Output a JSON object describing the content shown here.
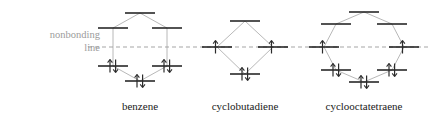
{
  "figure": {
    "background_color": "#ffffff",
    "width": 431,
    "height": 125
  },
  "nonbonding": {
    "label_line1": "nonbonding",
    "label_line2": "line",
    "color": "#9b9b9b",
    "y": 47,
    "x_start": 88,
    "x_end": 428,
    "dash": "4 3"
  },
  "colors": {
    "level_bar": "#1a1a1a",
    "connector": "#b0b0b0",
    "electron": "#2b2b2b",
    "label_text": "#1a1a1a",
    "nonbonding_text": "#9b9b9b"
  },
  "molecules": [
    {
      "name": "benzene",
      "label": "benzene",
      "ring_size": 6,
      "pi_electrons": 6,
      "center_x": 140,
      "levels": [
        {
          "id": "b1",
          "x": 140,
          "y": 13,
          "width": 30,
          "electrons": 0,
          "degeneracy": 1,
          "type": "antibonding"
        },
        {
          "id": "b2",
          "x": 113,
          "y": 28,
          "width": 30,
          "electrons": 0,
          "degeneracy": 2,
          "type": "antibonding"
        },
        {
          "id": "b3",
          "x": 167,
          "y": 28,
          "width": 30,
          "electrons": 0,
          "degeneracy": 2,
          "type": "antibonding"
        },
        {
          "id": "b4",
          "x": 113,
          "y": 66,
          "width": 30,
          "electrons": 2,
          "degeneracy": 2,
          "type": "bonding"
        },
        {
          "id": "b5",
          "x": 167,
          "y": 66,
          "width": 30,
          "electrons": 2,
          "degeneracy": 2,
          "type": "bonding"
        },
        {
          "id": "b6",
          "x": 140,
          "y": 81,
          "width": 30,
          "electrons": 2,
          "degeneracy": 1,
          "type": "bonding"
        }
      ],
      "polygon": [
        [
          140,
          13
        ],
        [
          113,
          28
        ],
        [
          113,
          66
        ],
        [
          140,
          81
        ],
        [
          167,
          66
        ],
        [
          167,
          28
        ]
      ]
    },
    {
      "name": "cyclobutadiene",
      "label": "cyclobutadiene",
      "ring_size": 4,
      "pi_electrons": 4,
      "center_x": 245,
      "levels": [
        {
          "id": "c1",
          "x": 245,
          "y": 21,
          "width": 30,
          "electrons": 0,
          "degeneracy": 1,
          "type": "antibonding"
        },
        {
          "id": "c2",
          "x": 217,
          "y": 47,
          "width": 30,
          "electrons": 1,
          "degeneracy": 2,
          "type": "nonbonding"
        },
        {
          "id": "c3",
          "x": 273,
          "y": 47,
          "width": 30,
          "electrons": 1,
          "degeneracy": 2,
          "type": "nonbonding"
        },
        {
          "id": "c4",
          "x": 245,
          "y": 74,
          "width": 30,
          "electrons": 2,
          "degeneracy": 1,
          "type": "bonding"
        }
      ],
      "polygon": [
        [
          245,
          21
        ],
        [
          217,
          47
        ],
        [
          245,
          74
        ],
        [
          273,
          47
        ]
      ]
    },
    {
      "name": "cyclooctatetraene",
      "label": "cyclooctatetraene",
      "ring_size": 8,
      "pi_electrons": 8,
      "center_x": 364,
      "levels": [
        {
          "id": "o1",
          "x": 364,
          "y": 12,
          "width": 30,
          "electrons": 0,
          "degeneracy": 1,
          "type": "antibonding"
        },
        {
          "id": "o2",
          "x": 336,
          "y": 24,
          "width": 30,
          "electrons": 0,
          "degeneracy": 2,
          "type": "antibonding"
        },
        {
          "id": "o3",
          "x": 392,
          "y": 24,
          "width": 30,
          "electrons": 0,
          "degeneracy": 2,
          "type": "antibonding"
        },
        {
          "id": "o4",
          "x": 324,
          "y": 47,
          "width": 30,
          "electrons": 1,
          "degeneracy": 2,
          "type": "nonbonding"
        },
        {
          "id": "o5",
          "x": 404,
          "y": 47,
          "width": 30,
          "electrons": 1,
          "degeneracy": 2,
          "type": "nonbonding"
        },
        {
          "id": "o6",
          "x": 336,
          "y": 70,
          "width": 30,
          "electrons": 2,
          "degeneracy": 2,
          "type": "bonding"
        },
        {
          "id": "o7",
          "x": 392,
          "y": 70,
          "width": 30,
          "electrons": 2,
          "degeneracy": 2,
          "type": "bonding"
        },
        {
          "id": "o8",
          "x": 364,
          "y": 82,
          "width": 30,
          "electrons": 2,
          "degeneracy": 1,
          "type": "bonding"
        }
      ],
      "polygon": [
        [
          364,
          12
        ],
        [
          336,
          24
        ],
        [
          324,
          47
        ],
        [
          336,
          70
        ],
        [
          364,
          82
        ],
        [
          392,
          70
        ],
        [
          404,
          47
        ],
        [
          392,
          24
        ]
      ]
    }
  ]
}
